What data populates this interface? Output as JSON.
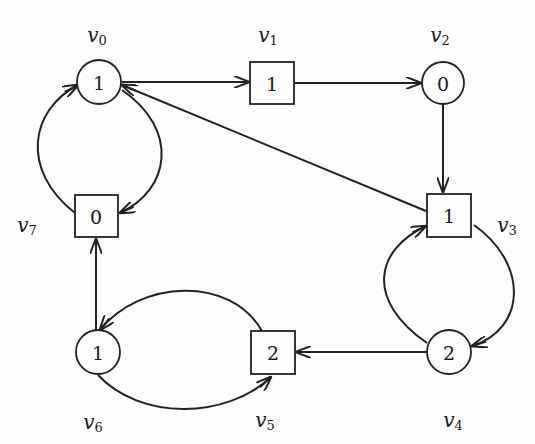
{
  "diagram": {
    "type": "directed-graph",
    "nodes": [
      {
        "id": "v0",
        "label": "v",
        "sub": "0",
        "shape": "circle",
        "value": "1",
        "cx": 99,
        "cy": 82
      },
      {
        "id": "v1",
        "label": "v",
        "sub": "1",
        "shape": "square",
        "value": "1",
        "cx": 272,
        "cy": 83
      },
      {
        "id": "v2",
        "label": "v",
        "sub": "2",
        "shape": "circle",
        "value": "0",
        "cx": 443,
        "cy": 83
      },
      {
        "id": "v3",
        "label": "v",
        "sub": "3",
        "shape": "square",
        "value": "1",
        "cx": 449,
        "cy": 215
      },
      {
        "id": "v4",
        "label": "v",
        "sub": "4",
        "shape": "circle",
        "value": "2",
        "cx": 449,
        "cy": 352
      },
      {
        "id": "v5",
        "label": "v",
        "sub": "5",
        "shape": "square",
        "value": "2",
        "cx": 272,
        "cy": 353
      },
      {
        "id": "v6",
        "label": "v",
        "sub": "6",
        "shape": "circle",
        "value": "1",
        "cx": 98,
        "cy": 352
      },
      {
        "id": "v7",
        "label": "v",
        "sub": "7",
        "shape": "square",
        "value": "0",
        "cx": 96,
        "cy": 216
      }
    ],
    "edges": [
      {
        "from": "v0",
        "to": "v1"
      },
      {
        "from": "v1",
        "to": "v2"
      },
      {
        "from": "v2",
        "to": "v3"
      },
      {
        "from": "v3",
        "to": "v0"
      },
      {
        "from": "v3",
        "to": "v4"
      },
      {
        "from": "v4",
        "to": "v3"
      },
      {
        "from": "v4",
        "to": "v5"
      },
      {
        "from": "v5",
        "to": "v6"
      },
      {
        "from": "v6",
        "to": "v5"
      },
      {
        "from": "v6",
        "to": "v7"
      },
      {
        "from": "v7",
        "to": "v0"
      },
      {
        "from": "v0",
        "to": "v7"
      }
    ]
  },
  "labels": {
    "v0": {
      "main": "v",
      "sub": "0"
    },
    "v1": {
      "main": "v",
      "sub": "1"
    },
    "v2": {
      "main": "v",
      "sub": "2"
    },
    "v3": {
      "main": "v",
      "sub": "3"
    },
    "v4": {
      "main": "v",
      "sub": "4"
    },
    "v5": {
      "main": "v",
      "sub": "5"
    },
    "v6": {
      "main": "v",
      "sub": "6"
    },
    "v7": {
      "main": "v",
      "sub": "7"
    }
  },
  "values": {
    "v0": "1",
    "v1": "1",
    "v2": "0",
    "v3": "1",
    "v4": "2",
    "v5": "2",
    "v6": "1",
    "v7": "0"
  },
  "colors": {
    "stroke": "#222222",
    "background": "#fdfdfd"
  }
}
